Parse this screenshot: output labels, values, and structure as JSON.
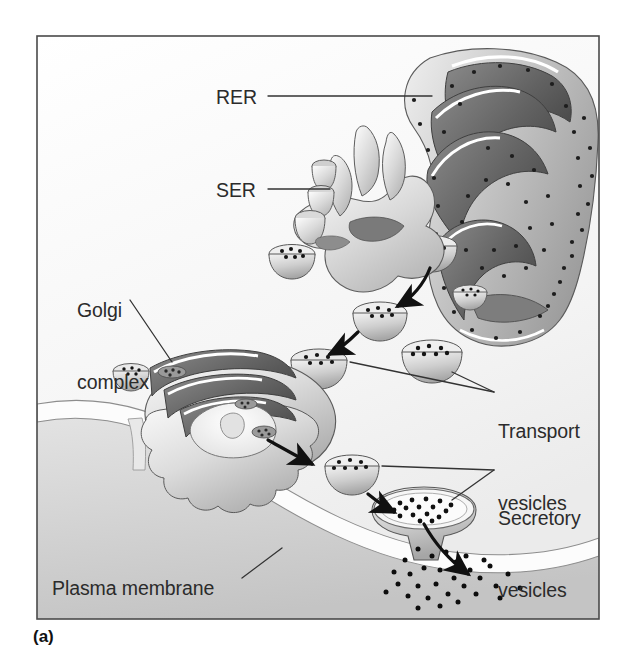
{
  "figure": {
    "caption": "(a)",
    "frame": {
      "border_color": "#4a4a4a",
      "background_color": "#ffffff"
    }
  },
  "labels": {
    "rer": "RER",
    "ser": "SER",
    "golgi_line1": "Golgi",
    "golgi_line2": "complex",
    "transport_line1": "Transport",
    "transport_line2": "vesicles",
    "secretory_line1": "Secretory",
    "secretory_line2": "vesicles",
    "plasma_membrane": "Plasma membrane"
  },
  "colors": {
    "text": "#2b2b2b",
    "leader_line": "#333333",
    "arrow": "#111111",
    "membrane_white": "#fbfbfb",
    "extracellular_gray": "#cfcfcf",
    "cytoplasm_gray": "#f2f2f2",
    "organelle_mid": "#b9b9b9",
    "organelle_dark": "#6f6f6f",
    "organelle_light": "#e4e4e4",
    "ribosome_dot": "#1a1a1a"
  },
  "structures": [
    {
      "name": "rough-endoplasmic-reticulum",
      "abbrev": "RER",
      "has_ribosomes": true
    },
    {
      "name": "smooth-endoplasmic-reticulum",
      "abbrev": "SER",
      "has_ribosomes": false
    },
    {
      "name": "golgi-complex",
      "abbrev": "Golgi complex",
      "has_ribosomes": false
    },
    {
      "name": "transport-vesicle",
      "count": 6
    },
    {
      "name": "secretory-vesicle",
      "count": 2
    },
    {
      "name": "plasma-membrane"
    }
  ],
  "flow_arrows": [
    {
      "from": "rough-endoplasmic-reticulum",
      "to": "transport-vesicle"
    },
    {
      "from": "transport-vesicle",
      "to": "golgi-complex"
    },
    {
      "from": "golgi-complex",
      "to": "secretory-vesicle"
    },
    {
      "from": "secretory-vesicle",
      "to": "plasma-membrane"
    },
    {
      "from": "plasma-membrane",
      "to": "extracellular-space"
    }
  ]
}
